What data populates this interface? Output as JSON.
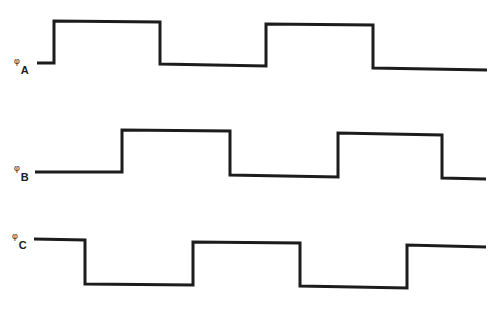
{
  "diagram": {
    "type": "timing-diagram",
    "signals": [
      {
        "name": "phase-a",
        "symbol": "φ",
        "subscript": "A",
        "label_pos": [
          14,
          57
        ],
        "points": "37,63 54,63 54,21 160,22 160,64 266,66 266,24 373,25 373,68 487,70"
      },
      {
        "name": "phase-b",
        "symbol": "φ",
        "subscript": "B",
        "label_pos": [
          14,
          164
        ],
        "points": "35,172 122,172 122,130 230,131 230,175 338,177 338,133 442,135 442,178 486,179"
      },
      {
        "name": "phase-c",
        "symbol": "φ",
        "subscript": "C",
        "label_pos": [
          12,
          232
        ],
        "points": "34,239 85,240 85,284 193,285 193,242 300,243 300,286 407,288 407,245 486,247"
      }
    ],
    "stroke_color": "#1c1c1c",
    "background": "#ffffff"
  }
}
